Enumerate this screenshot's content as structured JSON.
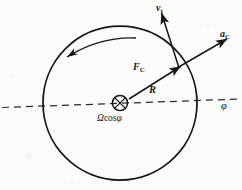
{
  "figure": {
    "kind": "physics-vector-diagram",
    "caption_absent": true,
    "background_color": "#fbfbfa",
    "ink_color": "#16161a"
  },
  "labels": {
    "velocity": {
      "symbol": "v",
      "subscript": "t"
    },
    "acceleration": {
      "symbol": "a",
      "subscript": "C"
    },
    "force": {
      "symbol": "F",
      "subscript": "C"
    },
    "radius": {
      "symbol": "R"
    },
    "angular_rate": {
      "text": "Ω",
      "cos": "cos",
      "angle": "φ"
    },
    "latitude_axis": {
      "symbol": "φ"
    }
  },
  "geometry": {
    "circle": {
      "cx": 120,
      "cy": 103,
      "r": 77,
      "stroke": "#16161a",
      "stroke_width": 1.7
    },
    "center_marker": {
      "type": "circle-x",
      "cx": 120,
      "cy": 103,
      "r": 8
    },
    "dashed_axis": {
      "x1": 2,
      "y1": 107,
      "x2": 240,
      "y2": 99,
      "dash": "7 5"
    },
    "rotation_arrow": {
      "direction": "counterclockwise",
      "description": "curved arrow inside upper part of circle pointing left"
    },
    "vectors": [
      {
        "name": "force-vector",
        "from": [
          122,
          102
        ],
        "to": [
          181,
          66
        ],
        "label_at": [
          140,
          66
        ]
      },
      {
        "name": "acceleration-vector",
        "from": [
          181,
          66
        ],
        "to": [
          226,
          40
        ],
        "label_at": [
          223,
          33
        ]
      },
      {
        "name": "velocity-vector",
        "from": [
          181,
          66
        ],
        "to": [
          161,
          12
        ],
        "label_at": [
          160,
          6
        ]
      }
    ],
    "radius_label_at": [
      152,
      91
    ],
    "omega_label_at": [
      99,
      117
    ],
    "phi_label_at": [
      222,
      105
    ]
  }
}
